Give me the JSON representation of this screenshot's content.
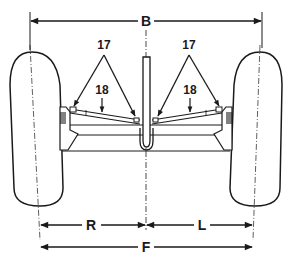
{
  "diagram": {
    "dimensions": {
      "top": "B",
      "bottom_total": "F",
      "bottom_right_half": "R",
      "bottom_left_half": "L"
    },
    "callouts": {
      "left_tie_rod_ends": "17",
      "right_tie_rod_ends": "17",
      "left_tie_rod": "18",
      "right_tie_rod": "18"
    },
    "colors": {
      "ink": "#1a1a1a",
      "background": "#ffffff"
    }
  }
}
